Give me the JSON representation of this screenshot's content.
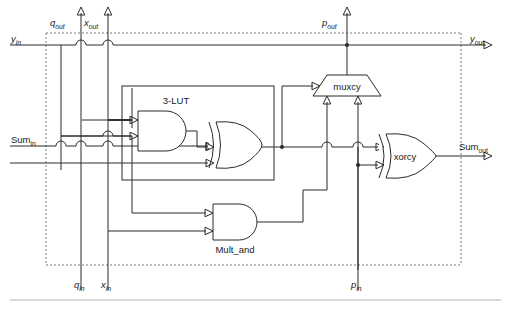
{
  "figure": {
    "kind": "digital-logic-schematic"
  },
  "labels": {
    "q_out": {
      "base": "q",
      "sub": "out"
    },
    "x_out": {
      "base": "x",
      "sub": "out"
    },
    "p_out": {
      "base": "p",
      "sub": "out"
    },
    "y_in": {
      "base": "y",
      "sub": "in"
    },
    "y_out": {
      "base": "y",
      "sub": "out"
    },
    "sum_in": {
      "base": "Sum",
      "sub": "in"
    },
    "sum_out": {
      "base": "Sum",
      "sub": "out"
    },
    "q_in": {
      "base": "q",
      "sub": "in"
    },
    "x_in": {
      "base": "x",
      "sub": "in"
    },
    "p_in": {
      "base": "p",
      "sub": "in"
    }
  },
  "blocks": {
    "lut": {
      "label": "3-LUT"
    },
    "muxcy": {
      "label": "muxcy"
    },
    "xorcy": {
      "label": "xorcy"
    },
    "mult_and": {
      "label": "Mult_and"
    }
  },
  "colors": {
    "wire": "#2b2b2b",
    "dashed_boundary": "#7a7a7a",
    "text": "#1a1a1a",
    "background": "#ffffff",
    "footer_rule": "#b0b0b0"
  }
}
